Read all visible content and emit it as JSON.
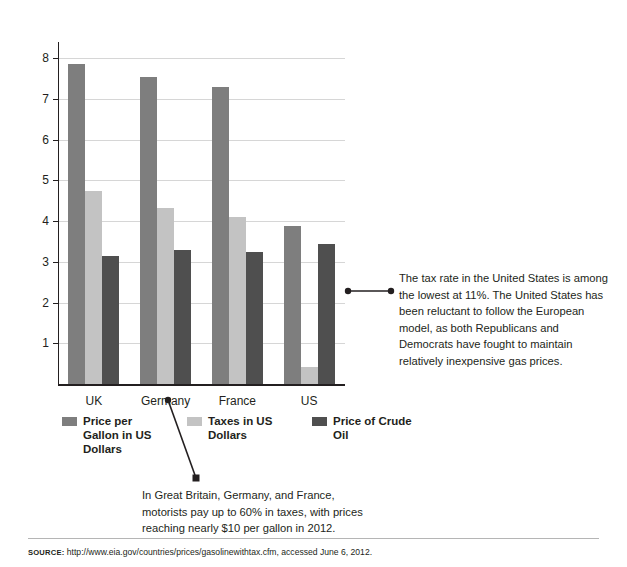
{
  "chart_data": {
    "type": "bar",
    "title": "",
    "xlabel": "",
    "ylabel": "",
    "categories": [
      "UK",
      "Germany",
      "France",
      "US"
    ],
    "series": [
      {
        "name": "Price per Gallon in US Dollars",
        "color": "#7e7e7e",
        "values": [
          7.85,
          7.55,
          7.3,
          3.87
        ]
      },
      {
        "name": "Taxes in US Dollars",
        "color": "#c3c3c3",
        "values": [
          4.75,
          4.32,
          4.1,
          0.43
        ]
      },
      {
        "name": "Price of Crude Oil",
        "color": "#4f4f4f",
        "values": [
          3.15,
          3.28,
          3.24,
          3.45
        ]
      }
    ],
    "ylim": [
      0,
      8.4
    ],
    "yticks": [
      1,
      2,
      3,
      4,
      5,
      6,
      7,
      8
    ],
    "ytick_labels": [
      "1",
      "2",
      "3",
      "4",
      "5",
      "6",
      "7",
      "8"
    ],
    "grid": true,
    "legend_position": "bottom"
  },
  "legend": {
    "items": [
      {
        "label": "Price per Gallon in US Dollars",
        "swatch": "s0"
      },
      {
        "label": "Taxes in US Dollars",
        "swatch": "s1"
      },
      {
        "label": "Price of Crude Oil",
        "swatch": "s2"
      }
    ]
  },
  "annotations": {
    "right": "The tax rate in the United States is among the lowest at 11%. The United States has been reluctant to follow the European model, as both Republicans and Democrats have fought to maintain relatively inexpensive gas prices.",
    "bottom": "In Great Britain, Germany, and France, motorists pay up to 60% in taxes, with prices reaching nearly $10 per gallon in 2012."
  },
  "source": {
    "label": "SOURCE:",
    "text": "http://www.eia.gov/countries/prices/gasolinewithtax.cfm, accessed June 6, 2012."
  }
}
